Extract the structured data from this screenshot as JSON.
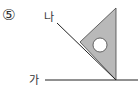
{
  "problem": {
    "number": "⑤"
  },
  "labels": {
    "line_na": "나",
    "line_ga": "가"
  },
  "colors": {
    "triangle_fill": "#b9b9b9",
    "stroke": "#222222",
    "hole": "#ffffff"
  }
}
